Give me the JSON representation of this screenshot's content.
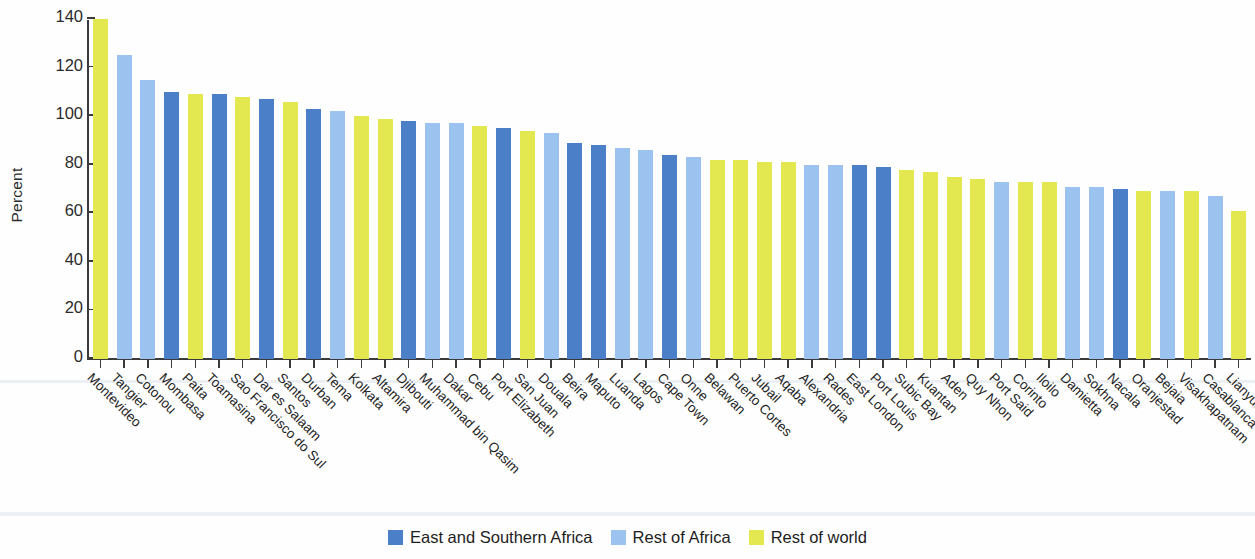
{
  "chart_data": {
    "type": "bar",
    "title": "",
    "xlabel": "",
    "ylabel": "Percent",
    "ylim": [
      0,
      140
    ],
    "yticks": [
      0,
      20,
      40,
      60,
      80,
      100,
      120,
      140
    ],
    "grid": false,
    "legend_position": "bottom-center",
    "series_colors": {
      "East and Southern Africa": "#4b80c9",
      "Rest of Africa": "#9cc3ef",
      "Rest of world": "#e4e850"
    },
    "legend": [
      {
        "label": "East and Southern Africa",
        "color": "#4b80c9",
        "key": "esa"
      },
      {
        "label": "Rest of Africa",
        "color": "#9cc3ef",
        "key": "roa"
      },
      {
        "label": "Rest of world",
        "color": "#e4e850",
        "key": "row"
      }
    ],
    "categories": [
      "Montevideo",
      "Tangier",
      "Cotonou",
      "Mombasa",
      "Paita",
      "Toamasina",
      "Sao Francisco do Sul",
      "Dar es Salaam",
      "Santos",
      "Durban",
      "Tema",
      "Kolkata",
      "Altamira",
      "Djibouti",
      "Muhammad bin Qasim",
      "Dakar",
      "Cebu",
      "Port Elizabeth",
      "San Juan",
      "Douala",
      "Beira",
      "Maputo",
      "Luanda",
      "Lagos",
      "Cape Town",
      "Onne",
      "Belawan",
      "Puerto Cortes",
      "Jubail",
      "Aqaba",
      "Alexandria",
      "Rades",
      "East London",
      "Port Louis",
      "Subic Bay",
      "Kuantan",
      "Aden",
      "Quy Nhon",
      "Port Said",
      "Corinto",
      "Iloilo",
      "Damietta",
      "Sokhna",
      "Nacala",
      "Oranjestad",
      "Bejaia",
      "Visakhapatnam",
      "Casablanca",
      "Lianyungang"
    ],
    "values": [
      140,
      125,
      115,
      110,
      109,
      109,
      108,
      107,
      106,
      103,
      102,
      100,
      99,
      98,
      97,
      97,
      96,
      95,
      94,
      93,
      89,
      88,
      87,
      86,
      84,
      83,
      82,
      82,
      81,
      81,
      80,
      80,
      80,
      79,
      78,
      77,
      75,
      74,
      73,
      73,
      73,
      71,
      71,
      70,
      69,
      69,
      69,
      67,
      61
    ],
    "groups": [
      "row",
      "roa",
      "roa",
      "esa",
      "row",
      "esa",
      "row",
      "esa",
      "row",
      "esa",
      "roa",
      "row",
      "row",
      "esa",
      "roa",
      "roa",
      "row",
      "esa",
      "row",
      "roa",
      "esa",
      "esa",
      "roa",
      "roa",
      "esa",
      "roa",
      "row",
      "row",
      "row",
      "row",
      "roa",
      "roa",
      "esa",
      "esa",
      "row",
      "row",
      "row",
      "row",
      "roa",
      "row",
      "row",
      "roa",
      "roa",
      "esa",
      "row",
      "roa",
      "row",
      "roa",
      "row"
    ]
  }
}
